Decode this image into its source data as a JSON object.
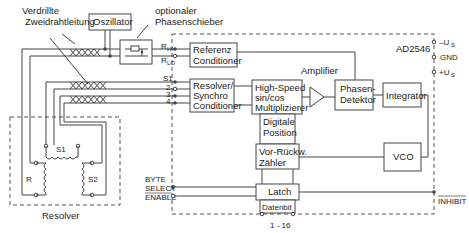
{
  "diagram": {
    "chip_label": "AD2546",
    "labels": {
      "twisted_pair": [
        "Verdrillte",
        "Zweidrahtleitung"
      ],
      "phase_shifter": [
        "optionaler",
        "Phasenschieber"
      ],
      "amplifier": "Amplifier",
      "resolver": "Resolver",
      "r_hi": "R",
      "r_hi_sub": "HI",
      "r_lo": "R",
      "r_lo_sub": "LO",
      "s1": "S1",
      "pin2": "2",
      "pin3": "3",
      "pin4": "4",
      "minus_us": "–U",
      "minus_us_sub": "S",
      "gnd": "GND",
      "plus_us": "+U",
      "plus_us_sub": "S",
      "byte": "BYTE",
      "select": "SELECT",
      "enable": "ENABLE",
      "inhibit": "INHIBIT",
      "databits": "1 - 16",
      "coil_s1": "S1",
      "coil_s2": "S2",
      "coil_r": "R"
    },
    "blocks": {
      "oscillator": "Oszillator",
      "referenz": [
        "Referenz",
        "Conditioner"
      ],
      "resolver_cond": [
        "Resolver/",
        "Synchro",
        "Conditioner"
      ],
      "multiplier": [
        "High-Speed",
        "sin/cos",
        "Multiplizierer"
      ],
      "phase_detector": [
        "Phasen-",
        "Detektor"
      ],
      "integrator": "Integrator",
      "digital_position": [
        "Digitale",
        "Position"
      ],
      "counter": [
        "Vor-Rückw.",
        "Zähler"
      ],
      "vco": "VCO",
      "latch": "Latch",
      "datenbit": "Datenbit"
    }
  }
}
